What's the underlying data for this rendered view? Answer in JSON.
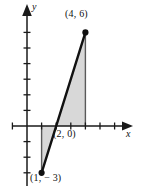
{
  "figure": {
    "kind": "cartesian-plane-shaded-triangles",
    "background_color": "#ffffff",
    "axis_color": "#1a1a1a",
    "outline_color": "#111111",
    "fill_color": "#d8d8d8",
    "axes": {
      "x_label": "x",
      "y_label": "y",
      "origin_px": {
        "x": 27,
        "y": 126
      },
      "unit_px": {
        "x": 14.6,
        "y": 15.6
      },
      "x_range": [
        -1,
        7
      ],
      "y_range": [
        -4,
        7
      ],
      "x_ticks": [
        -1,
        1,
        2,
        3,
        4,
        5,
        6
      ],
      "y_ticks": [
        -3,
        -2,
        -1,
        1,
        2,
        3,
        4,
        5,
        6
      ],
      "tick_length_px": 7,
      "grid": false
    },
    "points": [
      {
        "id": "p1",
        "label": "(1, − 3)",
        "x": 1,
        "y": -3,
        "marker": "filled-dot"
      },
      {
        "id": "p2",
        "label": "(2, 0)",
        "x": 2,
        "y": 0,
        "marker": "none"
      },
      {
        "id": "p3",
        "label": "(4, 6)",
        "x": 4,
        "y": 6,
        "marker": "filled-dot"
      }
    ],
    "shapes": [
      {
        "name": "upper-shaded-triangle",
        "vertices": [
          [
            2,
            0
          ],
          [
            4,
            6
          ],
          [
            4,
            0
          ]
        ],
        "fill": "#d8d8d8",
        "description": "region above x-axis bounded by the line, x = 4 and the x-axis"
      },
      {
        "name": "lower-shaded-triangle",
        "vertices": [
          [
            1,
            0
          ],
          [
            2,
            0
          ],
          [
            1,
            -3
          ]
        ],
        "fill": "#d8d8d8",
        "description": "region below x-axis bounded by the line, x = 1 and the x-axis"
      }
    ],
    "line_segment": {
      "name": "secant-line",
      "from": [
        1,
        -3
      ],
      "to": [
        4,
        6
      ],
      "stroke": "#111111",
      "width_px": 2.4
    },
    "verticals": [
      {
        "name": "vertical-at-x4",
        "x": 4,
        "from_y": 0,
        "to_y": 6,
        "stroke": "#555555"
      },
      {
        "name": "vertical-at-x1",
        "x": 1,
        "from_y": 0,
        "to_y": -3,
        "stroke": "#555555"
      }
    ]
  }
}
